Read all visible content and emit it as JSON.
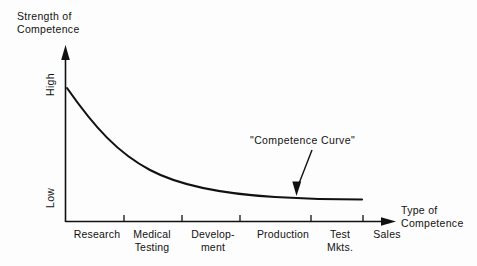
{
  "chart_data": {
    "type": "line",
    "title": "",
    "ylabel": "Strength of Competence",
    "ylabel_line1": "Strength of",
    "ylabel_line2": "Competence",
    "xlabel": "Type of Competence",
    "xlabel_line1": "Type of",
    "xlabel_line2": "Competence",
    "y_tick_labels": [
      "High",
      "Low"
    ],
    "y_high_label": "High",
    "y_low_label": "Low",
    "grid": false,
    "legend": false,
    "categories": [
      "Research",
      "Medical Testing",
      "Development",
      "Production",
      "Test Mkts.",
      "Sales"
    ],
    "category_labels": [
      {
        "line1": "Research",
        "line2": "",
        "x": 97
      },
      {
        "line1": "Medical",
        "line2": "Testing",
        "x": 152
      },
      {
        "line1": "Develop-",
        "line2": "ment",
        "x": 213
      },
      {
        "line1": "Production",
        "line2": "",
        "x": 283
      },
      {
        "line1": "Test",
        "line2": "Mkts.",
        "x": 340
      },
      {
        "line1": "Sales",
        "line2": "",
        "x": 387
      }
    ],
    "x": [
      0,
      1,
      2,
      3,
      4,
      5
    ],
    "values": [
      100,
      52,
      30,
      18,
      11,
      8
    ],
    "ylim": [
      0,
      110
    ],
    "annotations": [
      {
        "text": "\"Competence Curve\"",
        "points_to": "curve",
        "arrow": "down"
      }
    ],
    "line_color": "#111111",
    "axis_color": "#111111",
    "background_color": "#fdfdfd"
  },
  "annotation": {
    "competence_curve_label": "\"Competence Curve\""
  }
}
